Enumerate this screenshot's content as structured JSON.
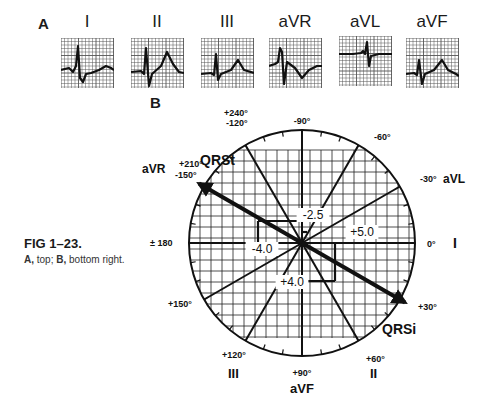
{
  "panel_a": {
    "label": "A",
    "leads": [
      {
        "name": "I"
      },
      {
        "name": "II"
      },
      {
        "name": "III"
      },
      {
        "name": "aVR"
      },
      {
        "name": "aVL"
      },
      {
        "name": "aVF"
      }
    ]
  },
  "panel_b": {
    "label": "B",
    "angle_labels": [
      {
        "id": "m90",
        "text": "-90°"
      },
      {
        "id": "m60",
        "text": "-60°"
      },
      {
        "id": "m30",
        "text": "-30°"
      },
      {
        "id": "p0",
        "text": "0°"
      },
      {
        "id": "p30",
        "text": "+30°"
      },
      {
        "id": "p60",
        "text": "+60°"
      },
      {
        "id": "p90",
        "text": "+90°"
      },
      {
        "id": "p120",
        "text": "+120°"
      },
      {
        "id": "p150",
        "text": "+150°"
      },
      {
        "id": "pm180",
        "text": "± 180"
      },
      {
        "id": "p210",
        "text": "+210°"
      },
      {
        "id": "m150",
        "text": "-150°"
      },
      {
        "id": "p240",
        "text": "+240°"
      },
      {
        "id": "m120",
        "text": "-120°"
      }
    ],
    "lead_axis_labels": [
      {
        "id": "I",
        "text": "I"
      },
      {
        "id": "II",
        "text": "II"
      },
      {
        "id": "III",
        "text": "III"
      },
      {
        "id": "aVR",
        "text": "aVR"
      },
      {
        "id": "aVL",
        "text": "aVL"
      },
      {
        "id": "aVF",
        "text": "aVF"
      }
    ],
    "vectors": [
      {
        "name": "QRSt",
        "text": "QRSt",
        "angle_deg": -150
      },
      {
        "name": "QRSi",
        "text": "QRSi",
        "angle_deg": 30
      }
    ],
    "measurements": [
      {
        "id": "v1",
        "text": "-2.5"
      },
      {
        "id": "v2",
        "text": "+5.0"
      },
      {
        "id": "v3",
        "text": "-4.0"
      },
      {
        "id": "v4",
        "text": "+4.0"
      }
    ]
  },
  "caption": {
    "title": "FIG 1–23.",
    "body_a": "A,",
    "body_a_text": " top; ",
    "body_b": "B,",
    "body_b_text": " bottom right."
  }
}
